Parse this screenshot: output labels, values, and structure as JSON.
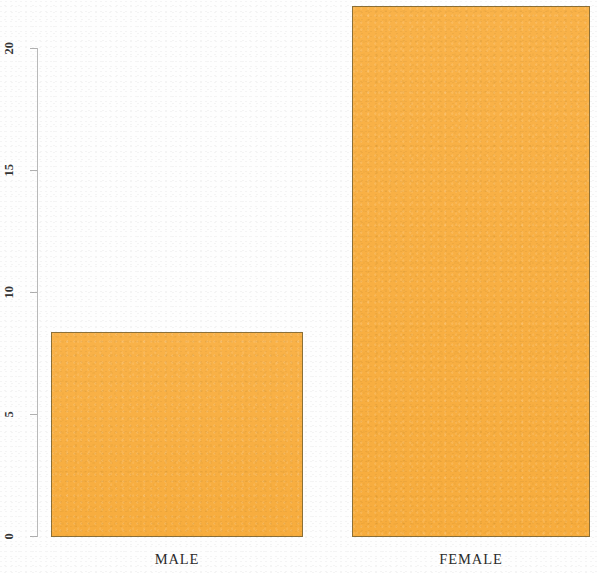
{
  "chart_data": {
    "type": "bar",
    "title": "",
    "subtitle": "",
    "xlabel": "",
    "ylabel": "",
    "categories": [
      "MALE",
      "FEMALE"
    ],
    "values": [
      8.4,
      21.7
    ],
    "ylim": [
      0,
      22
    ],
    "yticks": [
      0,
      5,
      10,
      15,
      20
    ],
    "ytick_labels": [
      "0",
      "5",
      "10",
      "15",
      "20"
    ],
    "grid": false,
    "legend": null,
    "bar_color": "#F9AE3F",
    "bar_border_color": "#8C7038",
    "axis_color": "#B9B9B9",
    "background_color": "#FEFEFE",
    "tick_label_rotation": 90,
    "annotations": []
  },
  "axis": {
    "ticks": [
      {
        "label": "20",
        "value": 20
      },
      {
        "label": "15",
        "value": 15
      },
      {
        "label": "10",
        "value": 10
      },
      {
        "label": "5",
        "value": 5
      },
      {
        "label": "0",
        "value": 0
      }
    ]
  },
  "bars": [
    {
      "label": "MALE",
      "value": 8.4
    },
    {
      "label": "FEMALE",
      "value": 21.7
    }
  ]
}
